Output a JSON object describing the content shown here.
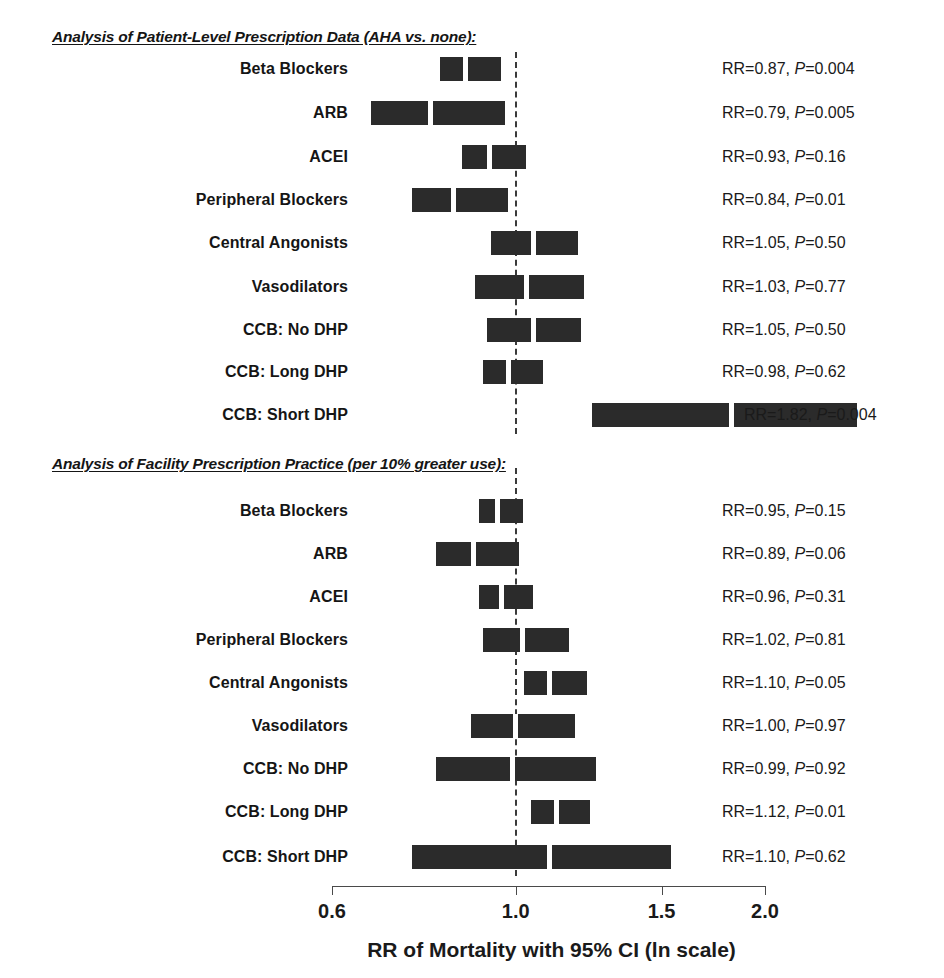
{
  "figure": {
    "axis_title": "RR of Mortality with 95% CI (ln scale)",
    "null_value_label": "1.0"
  },
  "chart_data": {
    "type": "forest",
    "title": "",
    "xlabel": "RR of Mortality with 95% CI (ln scale)",
    "ylabel": "",
    "scale": "log",
    "xlim": [
      0.6,
      2.0
    ],
    "xticks": [
      0.6,
      1.0,
      1.5,
      2.0
    ],
    "xtick_labels": [
      "0.6",
      "1.0",
      "1.5",
      "2.0"
    ],
    "null_line": 1.0,
    "grid": false,
    "legend": "none",
    "effect_measure": "RR",
    "sections": [
      {
        "header": "Analysis of Patient-Level Prescription Data (AHA vs. none):",
        "rows": [
          {
            "label": "Beta Blockers",
            "rr": 0.87,
            "ci_low": 0.8,
            "ci_high": 0.96,
            "p": "0.004",
            "stat_text": "RR=0.87, P=0.004"
          },
          {
            "label": "ARB",
            "rr": 0.79,
            "ci_low": 0.66,
            "ci_high": 0.97,
            "p": "0.005",
            "stat_text": "RR=0.79, P=0.005"
          },
          {
            "label": "ACEI",
            "rr": 0.93,
            "ci_low": 0.85,
            "ci_high": 1.03,
            "p": "0.16",
            "stat_text": "RR=0.93, P=0.16"
          },
          {
            "label": "Peripheral Blockers",
            "rr": 0.84,
            "ci_low": 0.74,
            "ci_high": 0.98,
            "p": "0.01",
            "stat_text": "RR=0.84, P=0.01"
          },
          {
            "label": "Central Angonists",
            "rr": 1.05,
            "ci_low": 0.92,
            "ci_high": 1.19,
            "p": "0.50",
            "stat_text": "RR=1.05, P=0.50"
          },
          {
            "label": "Vasodilators",
            "rr": 1.03,
            "ci_low": 0.88,
            "ci_high": 1.21,
            "p": "0.77",
            "stat_text": "RR=1.03, P=0.77"
          },
          {
            "label": "CCB: No DHP",
            "rr": 1.05,
            "ci_low": 0.91,
            "ci_high": 1.2,
            "p": "0.50",
            "stat_text": "RR=1.05, P=0.50"
          },
          {
            "label": "CCB: Long DHP",
            "rr": 0.98,
            "ci_low": 0.9,
            "ci_high": 1.08,
            "p": "0.62",
            "stat_text": "RR=0.98, P=0.62"
          },
          {
            "label": "CCB: Short DHP",
            "rr": 1.82,
            "ci_low": 1.22,
            "ci_high": 2.58,
            "p": "0.004",
            "stat_text": "RR=1.82, P=0.004"
          }
        ]
      },
      {
        "header": "Analysis of Facility Prescription Practice (per 10% greater use):",
        "rows": [
          {
            "label": "Beta Blockers",
            "rr": 0.95,
            "ci_low": 0.89,
            "ci_high": 1.02,
            "p": "0.15",
            "stat_text": "RR=0.95, P=0.15"
          },
          {
            "label": "ARB",
            "rr": 0.89,
            "ci_low": 0.79,
            "ci_high": 1.01,
            "p": "0.06",
            "stat_text": "RR=0.89, P=0.06"
          },
          {
            "label": "ACEI",
            "rr": 0.96,
            "ci_low": 0.89,
            "ci_high": 1.05,
            "p": "0.31",
            "stat_text": "RR=0.96, P=0.31"
          },
          {
            "label": "Peripheral Blockers",
            "rr": 1.02,
            "ci_low": 0.9,
            "ci_high": 1.16,
            "p": "0.81",
            "stat_text": "RR=1.02, P=0.81"
          },
          {
            "label": "Central Angonists",
            "rr": 1.1,
            "ci_low": 1.01,
            "ci_high": 1.22,
            "p": "0.05",
            "stat_text": "RR=1.10, P=0.05"
          },
          {
            "label": "Vasodilators",
            "rr": 1.0,
            "ci_low": 0.87,
            "ci_high": 1.18,
            "p": "0.97",
            "stat_text": "RR=1.00, P=0.97"
          },
          {
            "label": "CCB: No DHP",
            "rr": 0.99,
            "ci_low": 0.79,
            "ci_high": 1.25,
            "p": "0.92",
            "stat_text": "RR=0.99, P=0.92"
          },
          {
            "label": "CCB: Long DHP",
            "rr": 1.12,
            "ci_low": 1.03,
            "ci_high": 1.23,
            "p": "0.01",
            "stat_text": "RR=1.12, P=0.01"
          },
          {
            "label": "CCB: Short DHP",
            "rr": 1.1,
            "ci_low": 0.74,
            "ci_high": 1.54,
            "p": "0.62",
            "stat_text": "RR=1.10, P=0.62"
          }
        ]
      }
    ]
  },
  "layout": {
    "colors": {
      "bar": "#2b2b2b",
      "marker": "#ffffff",
      "null_line": "#3a3a3a",
      "axis": "#4a4a4a",
      "text": "#1a1a1a"
    }
  }
}
